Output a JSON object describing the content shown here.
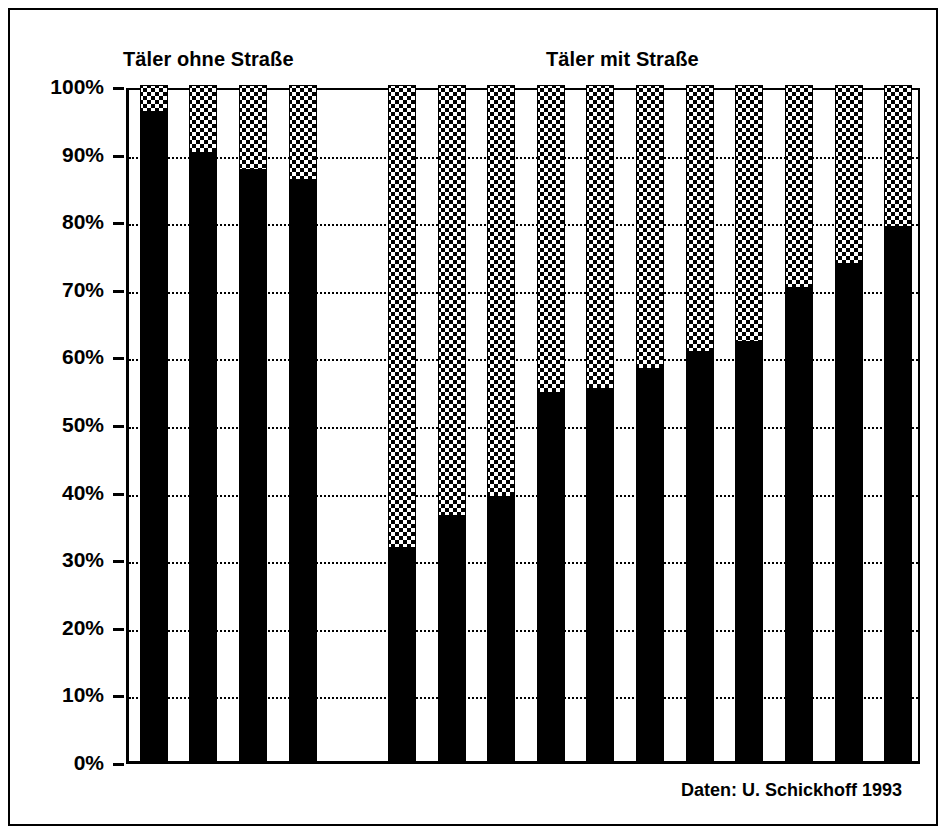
{
  "figure": {
    "source_note": "Daten: U. Schickhoff 1993"
  },
  "groups": {
    "left_label": "Täler ohne Straße",
    "right_label": "Täler mit Straße"
  },
  "axis": {
    "tick_labels": [
      "100%",
      "90%",
      "80%",
      "70%",
      "60%",
      "50%",
      "40%",
      "30%",
      "20%",
      "10%",
      "0%"
    ]
  },
  "chart_data": {
    "type": "bar",
    "title": "",
    "subtitle": "",
    "xlabel": "",
    "ylabel": "",
    "ylim": [
      0,
      100
    ],
    "ytick_values": [
      0,
      10,
      20,
      30,
      40,
      50,
      60,
      70,
      80,
      90,
      100
    ],
    "ytick_labels": [
      "0%",
      "10%",
      "20%",
      "30%",
      "40%",
      "50%",
      "60%",
      "70%",
      "80%",
      "90%",
      "100%"
    ],
    "grid": true,
    "legend": null,
    "stacked": true,
    "annotations": [
      "Täler ohne Straße",
      "Täler mit Straße",
      "Daten: U. Schickhoff 1993"
    ],
    "categories": [
      "ohne-1",
      "ohne-2",
      "ohne-3",
      "ohne-4",
      "gap",
      "mit-1",
      "mit-2",
      "mit-3",
      "mit-4",
      "mit-5",
      "mit-6",
      "mit-7",
      "mit-8",
      "mit-9",
      "mit-10",
      "mit-11"
    ],
    "series": [
      {
        "name": "schwarz (unterer Anteil)",
        "fill": "solid-black",
        "values": [
          96,
          90,
          87.5,
          86,
          null,
          31.5,
          36.3,
          39,
          54.5,
          55,
          58,
          60.5,
          62,
          70,
          73.5,
          79
        ]
      },
      {
        "name": "gepunktet (oberer Anteil bis 100%)",
        "fill": "dotted-white",
        "values": [
          4,
          10,
          12.5,
          14,
          null,
          68.5,
          63.7,
          61,
          45.5,
          45,
          42,
          39.5,
          38,
          30,
          26.5,
          21
        ]
      }
    ],
    "bars": [
      {
        "group": "Täler ohne Straße",
        "index": 1,
        "black_pct": 96,
        "dotted_pct": 4
      },
      {
        "group": "Täler ohne Straße",
        "index": 2,
        "black_pct": 90,
        "dotted_pct": 10
      },
      {
        "group": "Täler ohne Straße",
        "index": 3,
        "black_pct": 87.5,
        "dotted_pct": 12.5
      },
      {
        "group": "Täler ohne Straße",
        "index": 4,
        "black_pct": 86,
        "dotted_pct": 14
      },
      {
        "group": "Täler mit Straße",
        "index": 1,
        "black_pct": 31.5,
        "dotted_pct": 68.5
      },
      {
        "group": "Täler mit Straße",
        "index": 2,
        "black_pct": 36.3,
        "dotted_pct": 63.7
      },
      {
        "group": "Täler mit Straße",
        "index": 3,
        "black_pct": 39,
        "dotted_pct": 61
      },
      {
        "group": "Täler mit Straße",
        "index": 4,
        "black_pct": 54.5,
        "dotted_pct": 45.5
      },
      {
        "group": "Täler mit Straße",
        "index": 5,
        "black_pct": 55,
        "dotted_pct": 45
      },
      {
        "group": "Täler mit Straße",
        "index": 6,
        "black_pct": 58,
        "dotted_pct": 42
      },
      {
        "group": "Täler mit Straße",
        "index": 7,
        "black_pct": 60.5,
        "dotted_pct": 39.5
      },
      {
        "group": "Täler mit Straße",
        "index": 8,
        "black_pct": 62,
        "dotted_pct": 38
      },
      {
        "group": "Täler mit Straße",
        "index": 9,
        "black_pct": 70,
        "dotted_pct": 30
      },
      {
        "group": "Täler mit Straße",
        "index": 10,
        "black_pct": 73.5,
        "dotted_pct": 26.5
      },
      {
        "group": "Täler mit Straße",
        "index": 11,
        "black_pct": 79,
        "dotted_pct": 21
      }
    ]
  },
  "colors": {
    "bar_solid": "#000000",
    "bar_pattern_bg": "#ffffff",
    "bar_pattern_dot": "#000000",
    "axis": "#000000",
    "grid": "#000000",
    "background": "#ffffff",
    "frame": "#000000"
  }
}
